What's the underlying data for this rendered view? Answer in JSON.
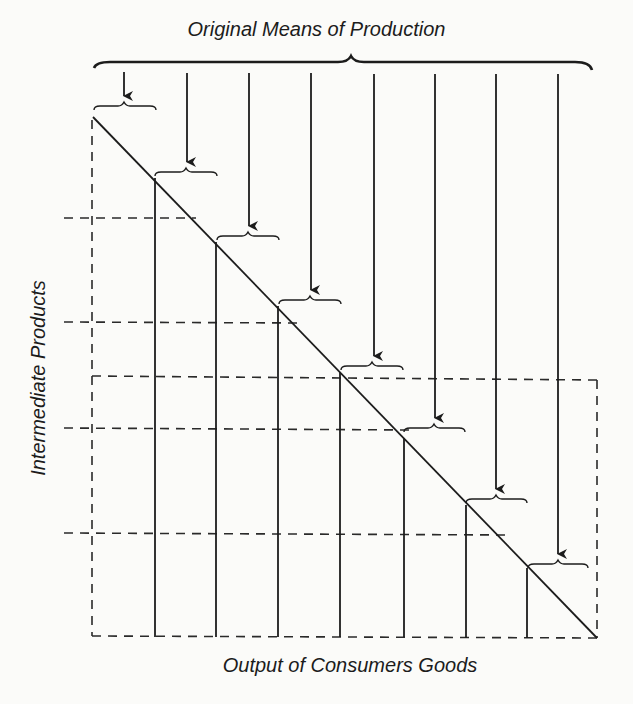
{
  "diagram": {
    "title": "Original Means of Production",
    "x_axis_label": "Output of Consumers Goods",
    "y_axis_label": "Intermediate Products",
    "stages": 8,
    "elements": {
      "top_brace": "brace spanning all original means of production",
      "arrows": "8 downward arrows, one per stage",
      "small_braces": "8 small braces marking each stage's input",
      "diagonal": "descending line from top-left to bottom-right",
      "vertical_lines": "7 solid verticals from diagonal to baseline",
      "dashed_lines": "dashed horizontals marking intermediate product levels; dashed frame"
    },
    "colors": {
      "ink": "#1c1c1c",
      "background": "#fbfbf9"
    }
  }
}
